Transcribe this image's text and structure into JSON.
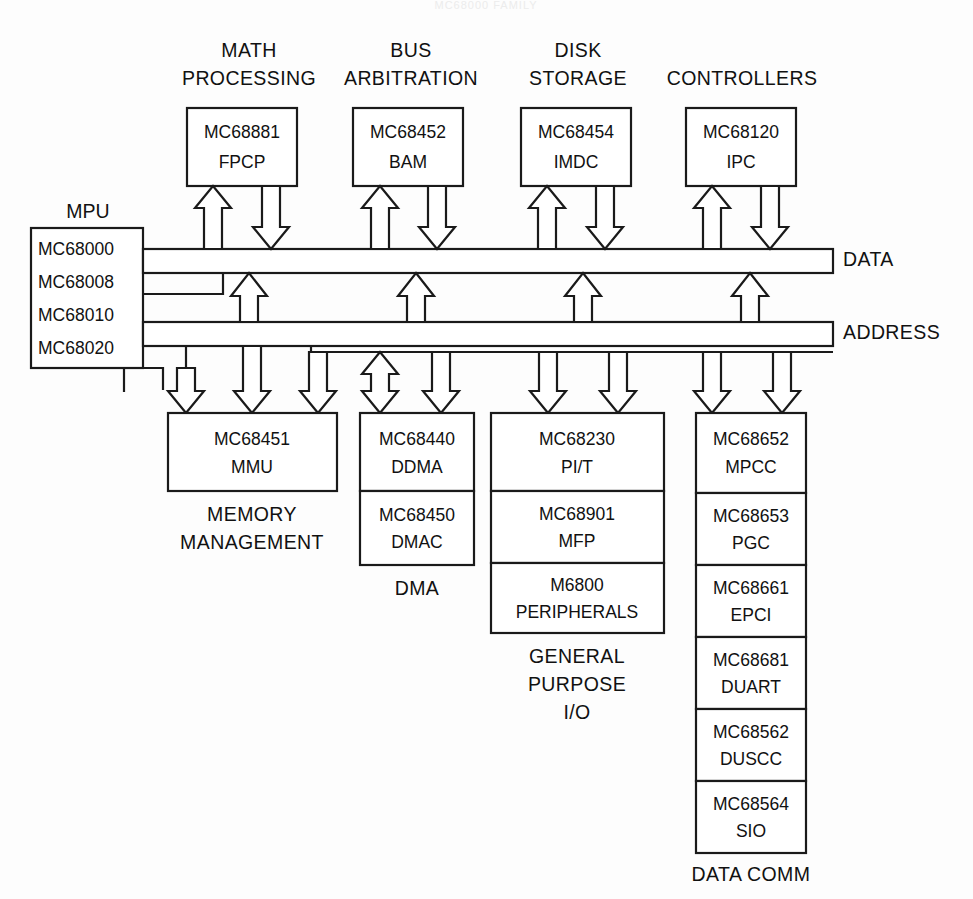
{
  "diagram": {
    "title": "MC68000 FAMILY",
    "background_color": "#fdfdfd",
    "line_color": "#1a1a1a",
    "text_color": "#111111"
  },
  "mpu": {
    "label": "MPU",
    "parts": [
      "MC68000",
      "MC68008",
      "MC68010",
      "MC68020"
    ]
  },
  "buses": [
    {
      "name": "DATA"
    },
    {
      "name": "ADDRESS"
    }
  ],
  "top_columns": [
    {
      "heading_line1": "MATH",
      "heading_line2": "PROCESSING",
      "part": "MC68881",
      "func": "FPCP"
    },
    {
      "heading_line1": "BUS",
      "heading_line2": "ARBITRATION",
      "part": "MC68452",
      "func": "BAM"
    },
    {
      "heading_line1": "DISK",
      "heading_line2": "STORAGE",
      "part": "MC68454",
      "func": "IMDC"
    },
    {
      "heading_line1": "",
      "heading_line2": "CONTROLLERS",
      "part": "MC68120",
      "func": "IPC"
    }
  ],
  "bottom_columns": [
    {
      "caption": [
        "MEMORY",
        "MANAGEMENT"
      ],
      "cells": [
        {
          "part": "MC68451",
          "func": "MMU"
        }
      ]
    },
    {
      "caption": [
        "DMA"
      ],
      "cells": [
        {
          "part": "MC68440",
          "func": "DDMA"
        },
        {
          "part": "MC68450",
          "func": "DMAC"
        }
      ]
    },
    {
      "caption": [
        "GENERAL",
        "PURPOSE",
        "I/O"
      ],
      "cells": [
        {
          "part": "MC68230",
          "func": "PI/T"
        },
        {
          "part": "MC68901",
          "func": "MFP"
        },
        {
          "part": "M6800",
          "func": "PERIPHERALS"
        }
      ]
    },
    {
      "caption": [
        "DATA COMM"
      ],
      "cells": [
        {
          "part": "MC68652",
          "func": "MPCC"
        },
        {
          "part": "MC68653",
          "func": "PGC"
        },
        {
          "part": "MC68661",
          "func": "EPCI"
        },
        {
          "part": "MC68681",
          "func": "DUART"
        },
        {
          "part": "MC68562",
          "func": "DUSCC"
        },
        {
          "part": "MC68564",
          "func": "SIO"
        }
      ]
    }
  ]
}
